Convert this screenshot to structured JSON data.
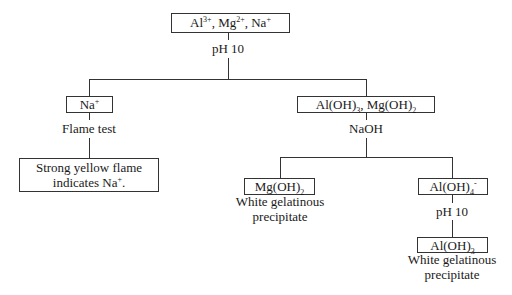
{
  "diagram": {
    "root": {
      "text_html": "Al<sup>3+</sup>, Mg<sup>2+</sup>, Na<sup>+</sup>",
      "ions": [
        "Al3+",
        "Mg2+",
        "Na+"
      ]
    },
    "step1_reagent": "pH 10",
    "left_branch": {
      "box": "Na+",
      "box_html": "Na<sup>+</sup>",
      "test": "Flame test",
      "result_line1": "Strong yellow flame",
      "result_line2_html": "indicates Na<sup>+</sup>."
    },
    "right_branch": {
      "box": "Al(OH)3, Mg(OH)2",
      "box_html": "Al(OH)<sub>3</sub>, Mg(OH)<sub>2</sub>",
      "reagent": "NaOH",
      "mg_product": {
        "box_html": "Mg(OH)<sub>2</sub>",
        "desc_line1": "White gelatinous",
        "desc_line2": "precipitate"
      },
      "al_product": {
        "box_html": "Al(OH)<sub>4</sub><sup>-</sup>",
        "reagent": "pH 10",
        "final_box_html": "Al(OH)<sub>3</sub>",
        "desc_line1": "White gelatinous",
        "desc_line2": "precipitate"
      }
    }
  }
}
